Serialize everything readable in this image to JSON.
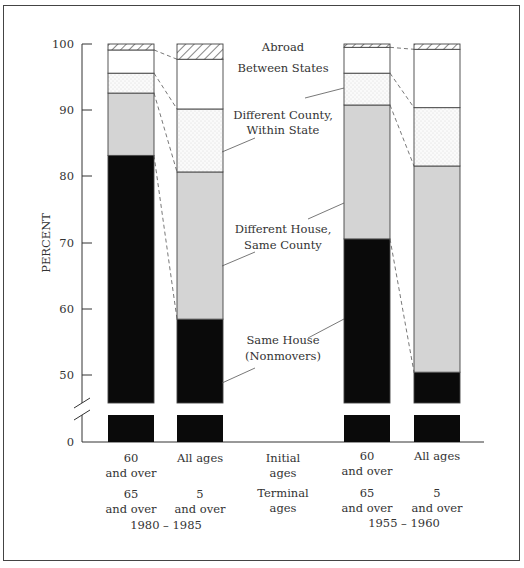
{
  "chart_data": {
    "type": "bar",
    "stacked": true,
    "title": "",
    "ylabel": "PERCENT",
    "xlabel": "",
    "ylim": [
      0,
      100
    ],
    "axis_break": true,
    "y_ticks": [
      0,
      50,
      60,
      70,
      80,
      90,
      100
    ],
    "grid": false,
    "categories": [
      {
        "initial_age": "60 and over",
        "terminal_age": "65 and over",
        "period": "1980 – 1985"
      },
      {
        "initial_age": "All ages",
        "terminal_age": "5 and over",
        "period": "1980 – 1985"
      },
      {
        "initial_age": "60 and over",
        "terminal_age": "65 and over",
        "period": "1955 – 1960"
      },
      {
        "initial_age": "All ages",
        "terminal_age": "5 and over",
        "period": "1955 – 1960"
      }
    ],
    "series": [
      {
        "name": "Same House (Nonmovers)",
        "fill": "#0a0a0a",
        "values": [
          83.2,
          58.5,
          70.6,
          50.5
        ]
      },
      {
        "name": "Different House, Same County",
        "fill": "#d4d4d4",
        "values": [
          9.4,
          22.2,
          20.2,
          31.1
        ]
      },
      {
        "name": "Different County, Within State",
        "fill": "dotted",
        "values": [
          3.0,
          9.5,
          4.8,
          8.8
        ]
      },
      {
        "name": "Between States",
        "fill": "#ffffff",
        "values": [
          3.5,
          7.5,
          3.9,
          8.8
        ]
      },
      {
        "name": "Abroad",
        "fill": "hatched",
        "values": [
          0.9,
          2.3,
          0.5,
          0.8
        ]
      }
    ],
    "cumulative_tops": [
      [
        83.2,
        92.6,
        95.6,
        99.1,
        100
      ],
      [
        58.5,
        80.7,
        90.2,
        97.7,
        100
      ],
      [
        70.6,
        90.8,
        95.6,
        99.5,
        100
      ],
      [
        50.5,
        81.6,
        90.4,
        99.2,
        100
      ]
    ],
    "annotations": [
      "Abroad",
      "Between States",
      "Different County, Within State",
      "Different House, Same County",
      "Same House (Nonmovers)"
    ]
  },
  "axis": {
    "ylabel": "PERCENT",
    "ticks": [
      "100",
      "90",
      "80",
      "70",
      "60",
      "50",
      "0"
    ]
  },
  "xlabels": {
    "row_initial": [
      "60",
      "and over",
      "All ages",
      "",
      "Initial",
      "ages",
      "60",
      "and over",
      "All ages",
      ""
    ],
    "b1_initial_1": "60",
    "b1_initial_2": "and over",
    "b2_initial_1": "All ages",
    "mid_initial_1": "Initial",
    "mid_initial_2": "ages",
    "b3_initial_1": "60",
    "b3_initial_2": "and over",
    "b4_initial_1": "All ages",
    "b1_terminal_1": "65",
    "b1_terminal_2": "and over",
    "b2_terminal_1": "5",
    "b2_terminal_2": "and over",
    "mid_terminal_1": "Terminal",
    "mid_terminal_2": "ages",
    "b3_terminal_1": "65",
    "b3_terminal_2": "and over",
    "b4_terminal_1": "5",
    "b4_terminal_2": "and over",
    "period_left": "1980 – 1985",
    "period_right": "1955 – 1960"
  },
  "legend_labels": {
    "abroad": "Abroad",
    "between_states": "Between States",
    "diff_county_1": "Different County,",
    "diff_county_2": "Within State",
    "diff_house_1": "Different House,",
    "diff_house_2": "Same County",
    "same_house_1": "Same House",
    "same_house_2": "(Nonmovers)"
  }
}
